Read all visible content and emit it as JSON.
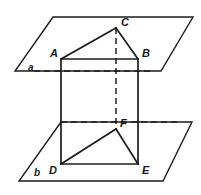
{
  "figure": {
    "canvas": {
      "width": 201,
      "height": 195,
      "background": "#ffffff"
    },
    "stroke_color": "#1c1c1c",
    "label_color": "#1a1a1a",
    "planes": [
      {
        "name": "alpha",
        "label": "a",
        "label_x": 28,
        "label_y": 71,
        "points": "53,17 193,17 161,71 15,71"
      },
      {
        "name": "b",
        "label": "b",
        "label_x": 34,
        "label_y": 176,
        "points": "61,122 192,122 163,181 19,181"
      }
    ],
    "vertices": [
      {
        "id": "A",
        "label": "A",
        "x": 61,
        "y": 59,
        "label_x": 50,
        "label_y": 57
      },
      {
        "id": "B",
        "label": "B",
        "x": 138,
        "y": 59,
        "label_x": 142,
        "label_y": 57
      },
      {
        "id": "C",
        "label": "C",
        "x": 116,
        "y": 28,
        "label_x": 121,
        "label_y": 26
      },
      {
        "id": "D",
        "label": "D",
        "x": 61,
        "y": 164,
        "label_x": 49,
        "label_y": 174
      },
      {
        "id": "E",
        "label": "E",
        "x": 138,
        "y": 164,
        "label_x": 142,
        "label_y": 174
      },
      {
        "id": "F",
        "label": "F",
        "x": 116,
        "y": 129,
        "label_x": 120,
        "label_y": 127
      }
    ],
    "solid_edges": [
      {
        "name": "edge-A-B",
        "d": "M 61,59 L 138,59"
      },
      {
        "name": "edge-A-C",
        "d": "M 61,59 L 116,28"
      },
      {
        "name": "edge-B-C",
        "d": "M 138,59 L 116,28"
      },
      {
        "name": "edge-A-D",
        "d": "M 61,59 L 61,164"
      },
      {
        "name": "edge-B-E",
        "d": "M 138,59 L 138,164"
      },
      {
        "name": "edge-D-E",
        "d": "M 61,164 L 138,164"
      },
      {
        "name": "edge-D-F",
        "d": "M 61,164 L 116,129"
      },
      {
        "name": "edge-E-F",
        "d": "M 138,164 L 116,129"
      }
    ],
    "hidden_edges": [
      {
        "name": "hidden-edge-C-F",
        "d": "M 116,28 L 116,129"
      },
      {
        "name": "hidden-line-plane-alpha",
        "d": "M 34,71 L 152,71"
      },
      {
        "name": "hidden-line-plane-b",
        "d": "M 61,122 L 180,122"
      }
    ]
  }
}
